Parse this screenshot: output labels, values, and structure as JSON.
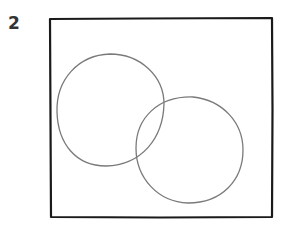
{
  "diagram": {
    "label": "2",
    "type": "venn",
    "frame": {
      "x": 50,
      "y": 18,
      "width": 222,
      "height": 199,
      "stroke": "#1a1a1a"
    },
    "sets": [
      {
        "name": "circle-left",
        "cx": 110,
        "cy": 110,
        "r": 54,
        "stroke": "#7a7a7a"
      },
      {
        "name": "circle-right",
        "cx": 189,
        "cy": 150,
        "r": 53,
        "stroke": "#7a7a7a"
      }
    ]
  }
}
